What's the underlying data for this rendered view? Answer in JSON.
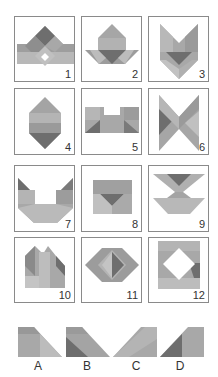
{
  "colors": {
    "dark": "#6e6e6e",
    "mid": "#9a9a9a",
    "light": "#b5b5b5",
    "pale": "#c8c8c8",
    "border": "#8a8a8a"
  },
  "figures": [
    {
      "label": "1"
    },
    {
      "label": "2"
    },
    {
      "label": "3"
    },
    {
      "label": "4"
    },
    {
      "label": "5"
    },
    {
      "label": "6"
    },
    {
      "label": "7"
    },
    {
      "label": "8"
    },
    {
      "label": "9"
    },
    {
      "label": "10"
    },
    {
      "label": "11"
    },
    {
      "label": "12"
    }
  ],
  "pieces": [
    {
      "label": "A"
    },
    {
      "label": "B"
    },
    {
      "label": "C"
    },
    {
      "label": "D"
    }
  ]
}
